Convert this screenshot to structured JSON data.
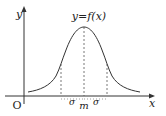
{
  "diagram": {
    "type": "normal-distribution-curve",
    "function_label": "y=f(x)",
    "axes": {
      "x_label": "x",
      "y_label": "y",
      "origin_label": "O"
    },
    "markers": {
      "mean_label": "m",
      "left_sigma_label": "σ",
      "right_sigma_label": "σ"
    },
    "colors": {
      "curve": "#333333",
      "axis": "#333333",
      "dashed": "#555555",
      "background": "#ffffff"
    }
  }
}
